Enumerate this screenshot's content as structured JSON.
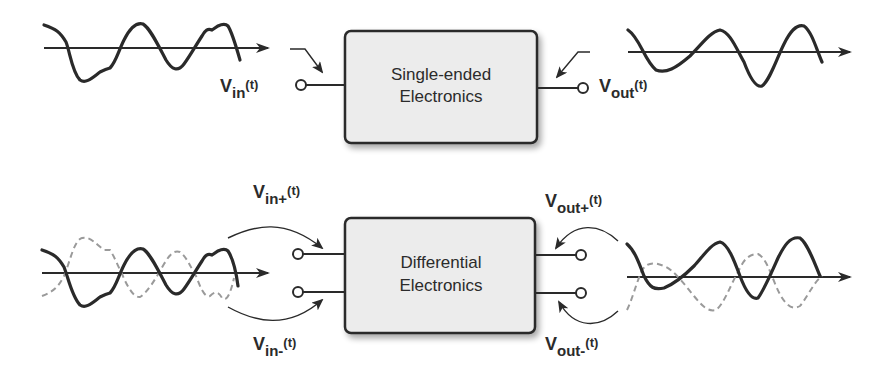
{
  "single_ended": {
    "block_label_line1": "Single-ended",
    "block_label_line2": "Electronics",
    "input_label": {
      "main": "V",
      "sub": "in",
      "sup": "(t)"
    },
    "output_label": {
      "main": "V",
      "sub": "out",
      "sup": "(t)"
    }
  },
  "differential": {
    "block_label_line1": "Differential",
    "block_label_line2": "Electronics",
    "input_plus_label": {
      "main": "V",
      "sub": "in+",
      "sup": "(t)"
    },
    "input_minus_label": {
      "main": "V",
      "sub": "in-",
      "sup": "(t)"
    },
    "output_plus_label": {
      "main": "V",
      "sub": "out+",
      "sup": "(t)"
    },
    "output_minus_label": {
      "main": "V",
      "sub": "out-",
      "sup": "(t)"
    }
  },
  "colors": {
    "line": "#2a2a2a",
    "dashed": "#9a9a9a",
    "box_fill": "#ececec",
    "box_stroke": "#2a2a2a"
  }
}
